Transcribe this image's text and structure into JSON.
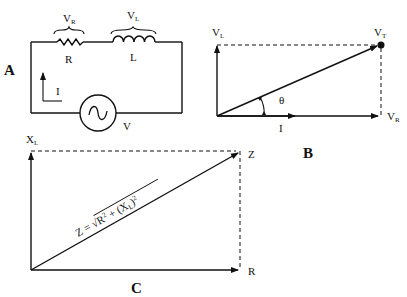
{
  "panels": {
    "A": {
      "label": "A",
      "title": "series RL circuit",
      "components": {
        "resistor": {
          "label": "R",
          "voltage_label": "V",
          "voltage_sub": "R"
        },
        "inductor": {
          "label": "L",
          "voltage_label": "V",
          "voltage_sub": "L"
        },
        "source": {
          "label": "V",
          "symbol": "ac-source"
        },
        "current": {
          "label": "I"
        }
      }
    },
    "B": {
      "label": "B",
      "title": "voltage phasor diagram",
      "vectors": {
        "vl": {
          "label": "V",
          "sub": "L"
        },
        "vr": {
          "label": "V",
          "sub": "R"
        },
        "vt": {
          "label": "V",
          "sub": "T"
        },
        "current": {
          "label": "I"
        },
        "angle": {
          "label": "θ"
        }
      }
    },
    "C": {
      "label": "C",
      "title": "impedance triangle",
      "vectors": {
        "xl": {
          "label": "X",
          "sub": "L"
        },
        "r": {
          "label": "R"
        },
        "z": {
          "label": "Z"
        }
      },
      "formula": {
        "lhs": "Z = ",
        "radical": "√",
        "r_term": "R",
        "r_exp": "2",
        "plus": " + (X",
        "xl_sub": "L",
        "close": ")",
        "xl_exp": "2"
      }
    }
  },
  "colors": {
    "ink": "#111111",
    "background": "#ffffff"
  }
}
